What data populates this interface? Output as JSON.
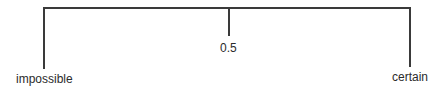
{
  "diagram": {
    "type": "probability-scale",
    "labels": {
      "left": "impossible",
      "middle": "0.5",
      "right": "certain"
    },
    "line_color": "#3a3a3a",
    "text_color": "#2b2b2b"
  }
}
